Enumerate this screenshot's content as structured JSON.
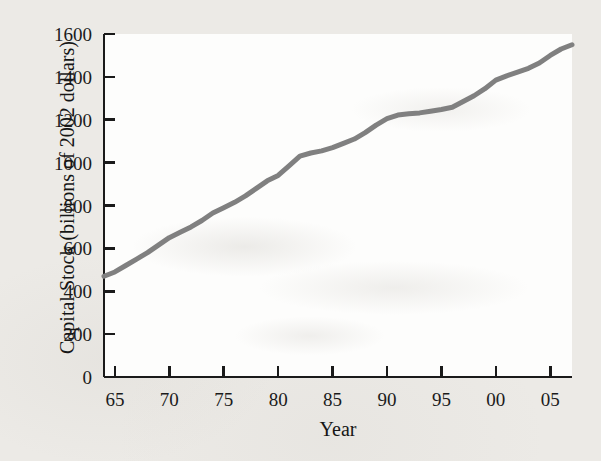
{
  "chart_data": {
    "type": "line",
    "title": "",
    "subtitle": "",
    "xlabel": "Year",
    "ylabel": "Capital Stock (billions of 2002 dollars)",
    "xlim": [
      1964,
      2007
    ],
    "ylim": [
      0,
      1600
    ],
    "grid": false,
    "legend": false,
    "legend_position": "none",
    "x_tick_labels": [
      "65",
      "70",
      "75",
      "80",
      "85",
      "90",
      "95",
      "00",
      "05"
    ],
    "x_tick_values": [
      1965,
      1970,
      1975,
      1980,
      1985,
      1990,
      1995,
      2000,
      2005
    ],
    "y_tick_labels": [
      "0",
      "200",
      "400",
      "600",
      "800",
      "1000",
      "1200",
      "1400",
      "1600"
    ],
    "y_tick_values": [
      0,
      200,
      400,
      600,
      800,
      1000,
      1200,
      1400,
      1600
    ],
    "series": [
      {
        "name": "Capital Stock",
        "color": "#808080",
        "x": [
          1964,
          1965,
          1966,
          1967,
          1968,
          1969,
          1970,
          1971,
          1972,
          1973,
          1974,
          1975,
          1976,
          1977,
          1978,
          1979,
          1980,
          1981,
          1982,
          1983,
          1984,
          1985,
          1986,
          1987,
          1988,
          1989,
          1990,
          1991,
          1992,
          1993,
          1994,
          1995,
          1996,
          1997,
          1998,
          1999,
          2000,
          2001,
          2002,
          2003,
          2004,
          2005,
          2006,
          2007
        ],
        "values": [
          470,
          490,
          520,
          550,
          580,
          615,
          650,
          675,
          700,
          730,
          765,
          790,
          815,
          845,
          880,
          915,
          940,
          985,
          1030,
          1045,
          1055,
          1070,
          1090,
          1110,
          1140,
          1175,
          1205,
          1222,
          1228,
          1232,
          1240,
          1248,
          1258,
          1285,
          1312,
          1345,
          1385,
          1405,
          1422,
          1440,
          1465,
          1500,
          1530,
          1550
        ]
      }
    ]
  },
  "axes": {
    "y_title": "Capital Stock (billions of 2002 dollars)",
    "x_title": "Year"
  },
  "colors": {
    "line": "#808080",
    "axis": "#1a1a1a",
    "page_background": "#eceae6",
    "plot_background": "#fdfdfc",
    "text": "#1b1b1b"
  }
}
